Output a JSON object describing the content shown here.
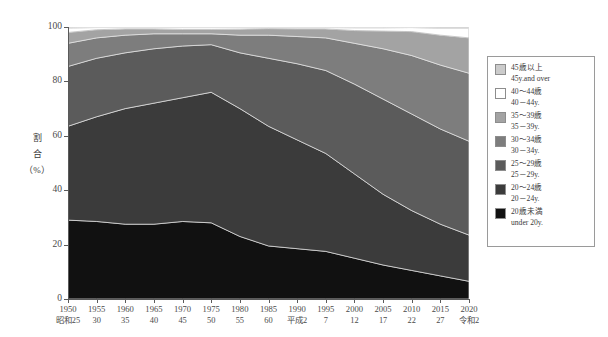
{
  "chart_data": {
    "type": "area",
    "stacked": true,
    "stack_mode": "percent",
    "title": "",
    "xlabel": "",
    "ylabel": "割合（%）",
    "ylim": [
      0,
      100
    ],
    "yticks": [
      0,
      20,
      40,
      60,
      80,
      100
    ],
    "grid": false,
    "legend_position": "right",
    "x": [
      1950,
      1955,
      1960,
      1965,
      1970,
      1975,
      1980,
      1985,
      1990,
      1995,
      2000,
      2005,
      2010,
      2015,
      2020
    ],
    "x_tick_labels": [
      "1950",
      "1955",
      "1960",
      "1965",
      "1970",
      "1975",
      "1980",
      "1985",
      "1990",
      "1995",
      "2000",
      "2005",
      "2010",
      "2015",
      "2020"
    ],
    "x_tick_era_labels": [
      "昭和25",
      "30",
      "35",
      "40",
      "45",
      "50",
      "55",
      "60",
      "平成2",
      "7",
      "12",
      "17",
      "22",
      "27",
      "令和2"
    ],
    "series": [
      {
        "name": "20歳未満",
        "name_en": "under 20y.",
        "color": "#111111",
        "values": [
          29.0,
          28.5,
          27.5,
          27.5,
          28.5,
          28.0,
          23.0,
          19.5,
          18.5,
          17.5,
          15.0,
          12.5,
          10.5,
          8.5,
          6.5
        ]
      },
      {
        "name": "20～24歳",
        "name_en": "20－24y.",
        "color": "#3b3b3b",
        "values": [
          34.5,
          38.5,
          42.5,
          44.5,
          45.5,
          48.0,
          47.0,
          44.0,
          40.0,
          36.0,
          31.0,
          26.0,
          22.0,
          19.0,
          17.0
        ]
      },
      {
        "name": "25～29歳",
        "name_en": "25－29y.",
        "color": "#5b5b5b",
        "values": [
          22.0,
          21.5,
          20.5,
          20.0,
          19.0,
          17.5,
          20.5,
          25.0,
          28.0,
          30.5,
          33.0,
          35.0,
          35.5,
          35.0,
          34.5
        ]
      },
      {
        "name": "30～34歳",
        "name_en": "30－34y.",
        "color": "#7d7d7d",
        "values": [
          8.5,
          7.5,
          6.5,
          5.5,
          4.5,
          4.0,
          6.5,
          8.5,
          10.0,
          12.0,
          15.0,
          18.5,
          21.5,
          23.5,
          25.0
        ]
      },
      {
        "name": "35～39歳",
        "name_en": "35－39y.",
        "color": "#a3a3a3",
        "values": [
          4.0,
          3.0,
          2.3,
          1.8,
          1.6,
          1.6,
          2.2,
          2.4,
          2.8,
          3.3,
          4.7,
          6.5,
          8.8,
          11.0,
          13.0
        ]
      },
      {
        "name": "40～44歳",
        "name_en": "40－44y.",
        "color": "#ffffff",
        "values": [
          1.6,
          0.8,
          0.5,
          0.5,
          0.7,
          0.7,
          0.6,
          0.4,
          0.5,
          0.5,
          1.0,
          1.2,
          1.5,
          2.5,
          3.5
        ]
      },
      {
        "name": "45歳以上",
        "name_en": "45y.and over",
        "color": "#cbcbcb",
        "values": [
          0.4,
          0.2,
          0.2,
          0.2,
          0.2,
          0.2,
          0.2,
          0.2,
          0.2,
          0.2,
          0.3,
          0.3,
          0.2,
          0.5,
          0.5
        ]
      }
    ]
  },
  "legend": {
    "items": [
      {
        "jp": "45歳以上",
        "en": "45y.and over",
        "color": "#cbcbcb"
      },
      {
        "jp": "40～44歳",
        "en": "40－44y.",
        "color": "#ffffff"
      },
      {
        "jp": "35～39歳",
        "en": "35－39y.",
        "color": "#a3a3a3"
      },
      {
        "jp": "30～34歳",
        "en": "30－34y.",
        "color": "#7d7d7d"
      },
      {
        "jp": "25～29歳",
        "en": "25－29y.",
        "color": "#5b5b5b"
      },
      {
        "jp": "20～24歳",
        "en": "20－24y.",
        "color": "#3b3b3b"
      },
      {
        "jp": "20歳未満",
        "en": "under 20y.",
        "color": "#111111"
      }
    ]
  },
  "yaxis": {
    "label_lines": [
      "割",
      "合",
      "（%）"
    ]
  }
}
